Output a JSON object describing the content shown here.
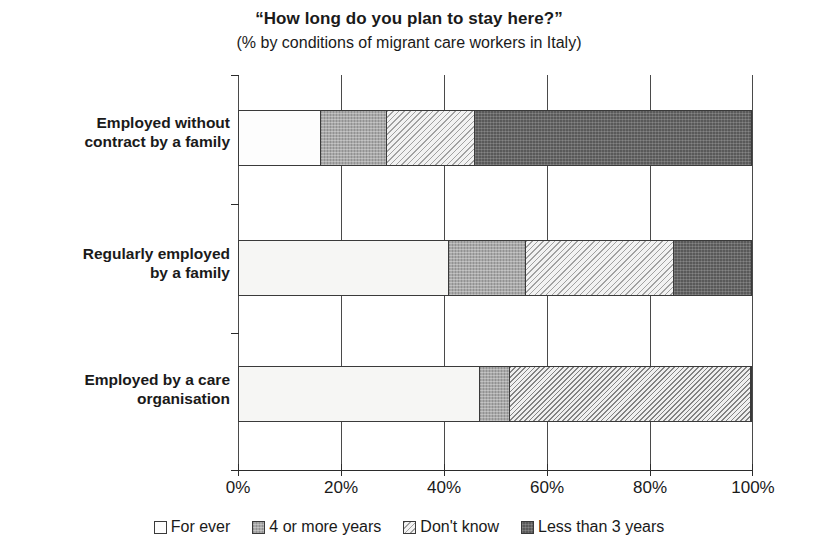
{
  "chart_data": {
    "type": "bar",
    "orientation": "horizontal",
    "stacked": true,
    "title": "“How  long do you plan to stay here?”",
    "subtitle": "(% by conditions of migrant care workers in Italy)",
    "xlabel": "",
    "ylabel": "",
    "xlim": [
      0,
      100
    ],
    "xticks": [
      "0%",
      "20%",
      "40%",
      "60%",
      "80%",
      "100%"
    ],
    "xtick_values": [
      0,
      20,
      40,
      60,
      80,
      100
    ],
    "grid": true,
    "legend_position": "bottom",
    "categories": [
      "Employed without contract by a family",
      "Regularly employed by a family",
      "Employed by a care organisation"
    ],
    "series": [
      {
        "name": "For ever",
        "values": [
          16,
          41,
          47
        ]
      },
      {
        "name": "4 or more years",
        "values": [
          13,
          15,
          6
        ]
      },
      {
        "name": "Don't know",
        "values": [
          17,
          29,
          47
        ]
      },
      {
        "name": "Less than 3 years",
        "values": [
          54,
          15,
          0
        ]
      }
    ]
  },
  "titles": {
    "main": "“How  long do you plan to stay here?”",
    "sub": "(% by conditions of migrant care workers in Italy)"
  },
  "axis": {
    "x_ticks": [
      {
        "label": "0%"
      },
      {
        "label": "20%"
      },
      {
        "label": "40%"
      },
      {
        "label": "60%"
      },
      {
        "label": "80%"
      },
      {
        "label": "100%"
      }
    ]
  },
  "rows": [
    {
      "line1": "Employed without",
      "line2": "contract by a family"
    },
    {
      "line1": "Regularly employed",
      "line2": "by a family"
    },
    {
      "line1": "Employed by a care",
      "line2": "organisation"
    }
  ],
  "legend": [
    {
      "label": "For ever",
      "color": "#fdfdfd",
      "pattern": "solid-white"
    },
    {
      "label": "4 or more years",
      "color": "#a9a9a9",
      "pattern": "noise-gray"
    },
    {
      "label": "Don't know",
      "color": "#f2f2f2",
      "pattern": "diagonal-hatch"
    },
    {
      "label": "Less than 3 years",
      "color": "#595959",
      "pattern": "dotted-dark"
    }
  ],
  "colors": {
    "axis": "#2b2b2b",
    "for_ever": "#fdfdfd",
    "four_or_more": "#a9a9a9",
    "dont_know": "#f2f2f2",
    "less_than_three": "#595959"
  }
}
